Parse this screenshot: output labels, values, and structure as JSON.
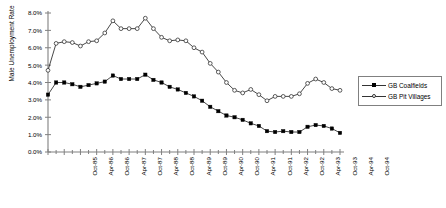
{
  "chart_data": {
    "type": "line",
    "title": "",
    "subtitle": "",
    "xlabel": "",
    "ylabel": "Male Unemployment Rate",
    "ylim": [
      0,
      0.08
    ],
    "ytick_labels": [
      "8.0%",
      "7.0%",
      "6.0%",
      "5.0%",
      "4.0%",
      "3.0%",
      "2.0%",
      "1.0%",
      "0.0%"
    ],
    "ytick_values": [
      8.0,
      7.0,
      6.0,
      5.0,
      4.0,
      3.0,
      2.0,
      1.0,
      0.0
    ],
    "grid": false,
    "legend_position": "right",
    "xtick_labels": [
      "Oct-85",
      "Apr-86",
      "Oct-86",
      "Apr-87",
      "Oct-87",
      "Apr-88",
      "Oct-88",
      "Apr-89",
      "Oct-89",
      "Apr-90",
      "Oct-90",
      "Apr-91",
      "Oct-91",
      "Apr-92",
      "Oct-92",
      "Apr-93",
      "Oct-93",
      "Apr-94",
      "Oct-94"
    ],
    "x": [
      "Oct-85",
      "Jan-86",
      "Apr-86",
      "Jul-86",
      "Oct-86",
      "Jan-87",
      "Apr-87",
      "Jul-87",
      "Oct-87",
      "Jan-88",
      "Apr-88",
      "Jul-88",
      "Oct-88",
      "Jan-89",
      "Apr-89",
      "Jul-89",
      "Oct-89",
      "Jan-90",
      "Apr-90",
      "Jul-90",
      "Oct-90",
      "Jan-91",
      "Apr-91",
      "Jul-91",
      "Oct-91",
      "Jan-92",
      "Apr-92",
      "Jul-92",
      "Oct-92",
      "Jan-93",
      "Apr-93",
      "Jul-93",
      "Oct-93",
      "Jan-94",
      "Apr-94",
      "Jul-94",
      "Oct-94"
    ],
    "series": [
      {
        "name": "GB Coalfields",
        "marker": "filled-square",
        "values": [
          3.3,
          4.0,
          4.0,
          3.9,
          3.75,
          3.85,
          3.95,
          4.05,
          4.4,
          4.2,
          4.2,
          4.2,
          4.45,
          4.15,
          4.0,
          3.75,
          3.6,
          3.4,
          3.2,
          2.95,
          2.6,
          2.35,
          2.1,
          2.0,
          1.85,
          1.65,
          1.5,
          1.2,
          1.15,
          1.2,
          1.15,
          1.15,
          1.45,
          1.55,
          1.5,
          1.35,
          1.1
        ]
      },
      {
        "name": "GB Pit Villages",
        "marker": "open-circle",
        "values": [
          4.7,
          6.25,
          6.35,
          6.3,
          6.1,
          6.35,
          6.4,
          6.85,
          7.55,
          7.1,
          7.1,
          7.1,
          7.7,
          7.1,
          6.6,
          6.4,
          6.45,
          6.4,
          6.0,
          5.75,
          5.1,
          4.6,
          4.0,
          3.55,
          3.4,
          3.6,
          3.3,
          2.95,
          3.2,
          3.2,
          3.2,
          3.35,
          3.95,
          4.2,
          4.0,
          3.65,
          3.55
        ]
      }
    ]
  },
  "legend": {
    "entries": [
      {
        "label": "GB Coalfields"
      },
      {
        "label": "GB Pit Villages"
      }
    ]
  },
  "colors": {
    "line": "#333333",
    "axis": "#808080",
    "text": "#000000",
    "background": "#ffffff"
  }
}
